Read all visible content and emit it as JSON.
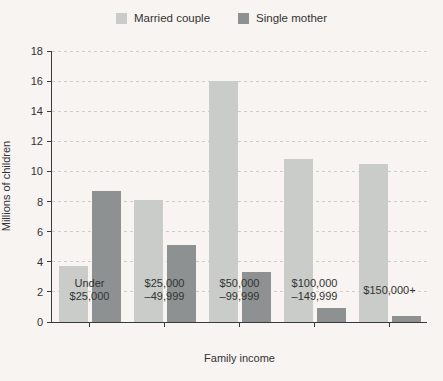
{
  "chart_data": {
    "type": "bar",
    "title": "",
    "categories": [
      [
        "Under",
        "$25,000"
      ],
      [
        "$25,000",
        "–49,999"
      ],
      [
        "$50,000",
        "–99,999"
      ],
      [
        "$100,000",
        "–149,999"
      ],
      [
        "$150,000+"
      ]
    ],
    "series": [
      {
        "name": "Married couple",
        "color": "#c9ccc8",
        "values": [
          3.7,
          8.1,
          16.0,
          10.8,
          10.5
        ]
      },
      {
        "name": "Single mother",
        "color": "#8d9191",
        "values": [
          8.7,
          5.1,
          3.3,
          0.9,
          0.4
        ]
      }
    ],
    "xlabel": "Family income",
    "ylabel": "Millions of children",
    "ylim": [
      0,
      18
    ],
    "yticks": [
      0,
      2,
      4,
      6,
      8,
      10,
      12,
      14,
      16,
      18
    ],
    "grid": "horizontal-dashed",
    "legend_position": "top-center"
  },
  "colors": {
    "background": "#f8f4f1",
    "axis": "#3a3a3a",
    "gridline": "#cfccc9",
    "text": "#333333",
    "married_couple_bar": "#c9ccc8",
    "single_mother_bar": "#8d9191"
  }
}
